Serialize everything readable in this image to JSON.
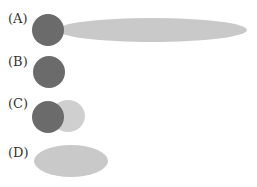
{
  "colors": {
    "dark": "#6b6b6b",
    "light": "#c9c9c9",
    "light_overlap": "#cfcfcf"
  },
  "options": [
    {
      "label": "(A)",
      "description": "dark circle with long light elongated ellipse extending right"
    },
    {
      "label": "(B)",
      "description": "dark circle alone"
    },
    {
      "label": "(C)",
      "description": "dark circle overlapping a light circle"
    },
    {
      "label": "(D)",
      "description": "light ellipse alone"
    }
  ]
}
